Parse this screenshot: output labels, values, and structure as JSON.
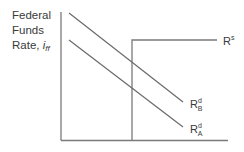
{
  "diagram": {
    "y_axis_label": {
      "line1": "Federal",
      "line2": "Funds",
      "line3_text": "Rate, ",
      "line3_var": "i",
      "line3_sub": "ff"
    },
    "x_axis_label": "",
    "curves": {
      "supply": {
        "base": "R",
        "sup": "s"
      },
      "demand_b": {
        "base": "R",
        "sup": "d",
        "sub": "B"
      },
      "demand_a": {
        "base": "R",
        "sup": "d",
        "sub": "A"
      }
    },
    "colors": {
      "lines": "#7a7a7a",
      "text": "#3a3a3a",
      "background": "#ffffff"
    }
  }
}
